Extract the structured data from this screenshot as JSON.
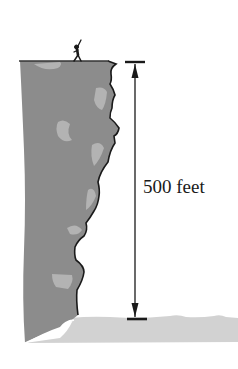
{
  "diagram": {
    "measurement_label": "500 feet",
    "elements": [
      "person-on-cliff-top",
      "cliff",
      "ground",
      "height-dimension-arrow"
    ],
    "colors": {
      "cliff": "#8c8c8c",
      "cliff_highlight": "#b3b3b3",
      "ground": "#d2d2d2",
      "ink": "#1a1a1a",
      "background": "#ffffff"
    }
  }
}
